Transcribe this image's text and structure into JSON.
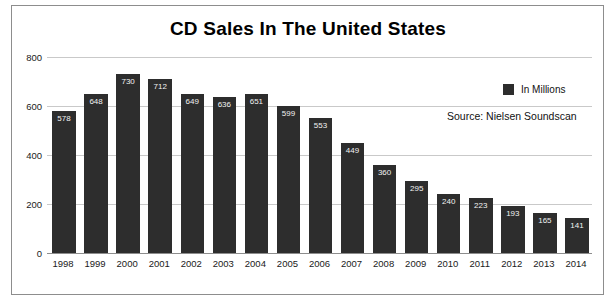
{
  "chart_data": {
    "type": "bar",
    "title": "CD Sales In The United States",
    "xlabel": "",
    "ylabel": "",
    "categories": [
      "1998",
      "1999",
      "2000",
      "2001",
      "2002",
      "2003",
      "2004",
      "2005",
      "2006",
      "2007",
      "2008",
      "2009",
      "2010",
      "2011",
      "2012",
      "2013",
      "2014"
    ],
    "values": [
      578,
      648,
      730,
      712,
      649,
      636,
      651,
      599,
      553,
      449,
      360,
      295,
      240,
      223,
      193,
      165,
      141
    ],
    "series": [
      {
        "name": "In Millions",
        "values": [
          578,
          648,
          730,
          712,
          649,
          636,
          651,
          599,
          553,
          449,
          360,
          295,
          240,
          223,
          193,
          165,
          141
        ]
      }
    ],
    "ylim": [
      0,
      800
    ],
    "yticks": [
      0,
      200,
      400,
      600,
      800
    ],
    "ytick_labels": [
      "0",
      "200",
      "400",
      "600",
      "800"
    ],
    "grid": true,
    "legend": {
      "position": "top-right",
      "entries": [
        {
          "label": "In Millions",
          "color": "#2d2d2d"
        }
      ]
    },
    "annotations": [
      {
        "text": "Source: Nielsen Soundscan"
      }
    ],
    "bar_color": "#2d2d2d",
    "data_labels": true,
    "background_color": "#ffffff"
  },
  "colors": {
    "bar": "#2d2d2d",
    "grid": "#c9c9c9",
    "frame": "#8d8d8d",
    "text": "#1a1a1a",
    "data_label": "#f2f2f2"
  }
}
